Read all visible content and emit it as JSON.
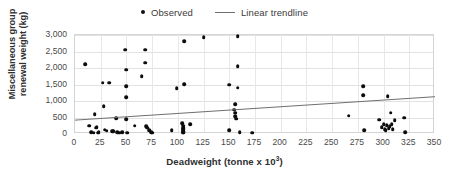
{
  "chart_data": {
    "type": "scatter",
    "title": "",
    "xlabel": "Deadweight (tonne x 10³)",
    "xlabel_base": "Deadweight (tonne x 10",
    "xlabel_sup": "3",
    "xlabel_tail": ")",
    "ylabel": "Miscellaneous group renewal weight (kg)",
    "xlim": [
      0,
      350
    ],
    "ylim": [
      0,
      3000
    ],
    "xticks": [
      0,
      25,
      50,
      75,
      100,
      125,
      150,
      175,
      200,
      225,
      250,
      275,
      300,
      325,
      350
    ],
    "xtick_labels": [
      "0",
      "25",
      "50",
      "75",
      "100",
      "125",
      "150",
      "175",
      "200",
      "225",
      "250",
      "275",
      "300",
      "325",
      "350"
    ],
    "yticks": [
      0,
      500,
      1000,
      1500,
      2000,
      2500,
      3000
    ],
    "ytick_labels": [
      "0",
      "500",
      "1,000",
      "1,500",
      "2,000",
      "2,500",
      "3,000"
    ],
    "grid": true,
    "grid_horizontal": true,
    "grid_vertical": true,
    "legend_position": "top-center",
    "marker_color": "#0c0c0c",
    "trendline_color": "#6f6f6f",
    "gridline_color": "#e2e2e2",
    "plot_border_color": "#d4d4d4",
    "series": [
      {
        "name": "Observed",
        "type": "scatter",
        "marker": "circle",
        "color": "#0c0c0c",
        "points": [
          [
            10,
            2120
          ],
          [
            14,
            250
          ],
          [
            16,
            60
          ],
          [
            18,
            45
          ],
          [
            19,
            600
          ],
          [
            20,
            190
          ],
          [
            21,
            200
          ],
          [
            22,
            40
          ],
          [
            23,
            60
          ],
          [
            27,
            1550
          ],
          [
            28,
            840
          ],
          [
            29,
            130
          ],
          [
            31,
            95
          ],
          [
            33,
            1550
          ],
          [
            36,
            85
          ],
          [
            37,
            80
          ],
          [
            40,
            470
          ],
          [
            41,
            60
          ],
          [
            43,
            40
          ],
          [
            46,
            55
          ],
          [
            49,
            2560
          ],
          [
            50,
            1950
          ],
          [
            50,
            1450
          ],
          [
            50,
            1120
          ],
          [
            50,
            450
          ],
          [
            51,
            40
          ],
          [
            58,
            250
          ],
          [
            65,
            1750
          ],
          [
            68,
            2560
          ],
          [
            68,
            2160
          ],
          [
            69,
            230
          ],
          [
            70,
            190
          ],
          [
            72,
            110
          ],
          [
            74,
            60
          ],
          [
            75,
            40
          ],
          [
            94,
            110
          ],
          [
            99,
            1380
          ],
          [
            104,
            330
          ],
          [
            105,
            250
          ],
          [
            105,
            190
          ],
          [
            105,
            160
          ],
          [
            105,
            130
          ],
          [
            105,
            90
          ],
          [
            105,
            60
          ],
          [
            105,
            40
          ],
          [
            106,
            2820
          ],
          [
            106,
            1510
          ],
          [
            112,
            290
          ],
          [
            125,
            2940
          ],
          [
            150,
            1500
          ],
          [
            150,
            120
          ],
          [
            155,
            740
          ],
          [
            156,
            900
          ],
          [
            156,
            640
          ],
          [
            156,
            540
          ],
          [
            157,
            460
          ],
          [
            158,
            2970
          ],
          [
            158,
            2050
          ],
          [
            158,
            1400
          ],
          [
            160,
            60
          ],
          [
            172,
            40
          ],
          [
            266,
            560
          ],
          [
            280,
            1450
          ],
          [
            280,
            1170
          ],
          [
            281,
            120
          ],
          [
            296,
            430
          ],
          [
            298,
            200
          ],
          [
            300,
            300
          ],
          [
            301,
            150
          ],
          [
            302,
            120
          ],
          [
            303,
            260
          ],
          [
            304,
            1140
          ],
          [
            305,
            170
          ],
          [
            306,
            230
          ],
          [
            307,
            640
          ],
          [
            308,
            300
          ],
          [
            309,
            140
          ],
          [
            311,
            420
          ],
          [
            320,
            500
          ],
          [
            321,
            60
          ]
        ]
      },
      {
        "name": "Linear trendline",
        "type": "line",
        "color": "#6f6f6f",
        "x": [
          0,
          350
        ],
        "y": [
          420,
          1130
        ]
      }
    ]
  },
  "legend": {
    "items": [
      {
        "label": "Observed",
        "marker": "dot-marker-icon"
      },
      {
        "label": "Linear trendline",
        "marker": "line-marker-icon"
      }
    ]
  }
}
